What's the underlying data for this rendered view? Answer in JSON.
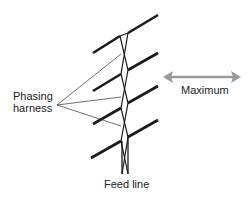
{
  "diagram": {
    "labels": {
      "harness_line1": "Phasing",
      "harness_line2": "harness",
      "maximum": "Maximum",
      "feed_line": "Feed line"
    },
    "colors": {
      "element": "#1a1a1a",
      "harness": "#333333",
      "arrow": "#9a9a9a",
      "text": "#222222"
    },
    "elements_count": 4,
    "radiation_direction": "bidirectional horizontal (broadside)"
  }
}
